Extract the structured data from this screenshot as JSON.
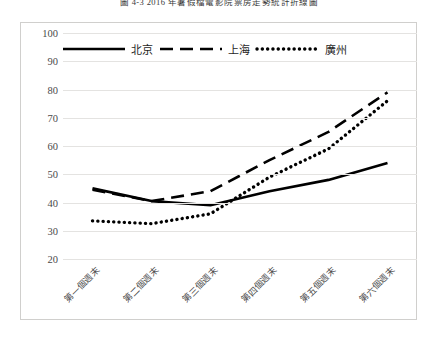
{
  "chart_data": {
    "type": "line",
    "title": "圖 4-3  2016 年暑假檔電影院票房走勢統計折線圖",
    "xlabel": "",
    "ylabel": "",
    "categories": [
      "第一個週末",
      "第二個週末",
      "第三個週末",
      "第四個週末",
      "第五個週末",
      "第六個週末"
    ],
    "ylim": [
      20,
      100
    ],
    "ytick_step": 10,
    "yticks": [
      "100",
      "90",
      "80",
      "70",
      "60",
      "50",
      "40",
      "30",
      "20"
    ],
    "grid": true,
    "legend_position": "top-inside",
    "series": [
      {
        "name": "北京",
        "style": "solid",
        "color": "#000000",
        "values": [
          45,
          40.5,
          39,
          44,
          48,
          54
        ]
      },
      {
        "name": "上海",
        "style": "dashed",
        "color": "#000000",
        "values": [
          44.5,
          40.5,
          44,
          55,
          65,
          79
        ]
      },
      {
        "name": "廣州",
        "style": "dotted",
        "color": "#000000",
        "values": [
          33.5,
          32.5,
          36,
          49,
          59,
          76
        ]
      }
    ]
  },
  "colors": {
    "gridline": "#e4e3e1",
    "frame": "#d0cfcd",
    "text": "#4a4a4a",
    "background": "#ffffff"
  }
}
